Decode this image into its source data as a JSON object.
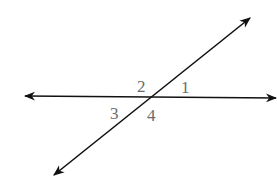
{
  "diagram": {
    "type": "intersecting-lines",
    "colors": {
      "line": "#111111",
      "label": "#6b6b6b",
      "background": "#ffffff"
    },
    "intersection": {
      "x": 151,
      "y": 97
    },
    "lines": [
      {
        "name": "horizontal-line",
        "from": {
          "x": 25,
          "y": 96
        },
        "to": {
          "x": 276,
          "y": 98
        },
        "arrows": "both"
      },
      {
        "name": "transversal-line",
        "from": {
          "x": 54,
          "y": 175
        },
        "to": {
          "x": 250,
          "y": 18
        },
        "arrows": "both"
      }
    ],
    "angle_labels": [
      {
        "text": "1",
        "x": 181,
        "y": 93
      },
      {
        "text": "2",
        "x": 137,
        "y": 92
      },
      {
        "text": "3",
        "x": 110,
        "y": 119
      },
      {
        "text": "4",
        "x": 147,
        "y": 121
      }
    ]
  }
}
